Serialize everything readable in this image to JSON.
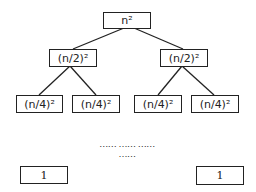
{
  "diagram": {
    "type": "recursion-tree",
    "levels": [
      {
        "depth": 0,
        "nodes": [
          "n²"
        ]
      },
      {
        "depth": 1,
        "nodes": [
          "(n/2)²",
          "(n/2)²"
        ]
      },
      {
        "depth": 2,
        "nodes": [
          "(n/4)²",
          "(n/4)²",
          "(n/4)²",
          "(n/4)²"
        ]
      }
    ],
    "ellipsis": "…… …… …… ……",
    "leaves": [
      "1",
      "1"
    ],
    "colors": {
      "stroke": "#222222",
      "background": "#ffffff"
    }
  }
}
